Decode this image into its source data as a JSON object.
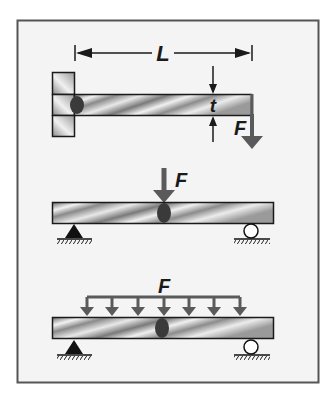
{
  "diagram": {
    "colors": {
      "frame_border": "#555555",
      "frame_fill": "#f4f4f4",
      "beam_outline": "#1a1a1a",
      "load_arrow": "#5a5a5a",
      "weld_dot": "#3a3a3a",
      "support": "#111111"
    },
    "panels": [
      {
        "name": "cantilever",
        "dimension_length_label": "L",
        "thickness_label": "t",
        "force_label": "F"
      },
      {
        "name": "simply-supported-point-load",
        "force_label": "F"
      },
      {
        "name": "simply-supported-distributed-load",
        "force_label": "F",
        "arrow_count": 7
      }
    ]
  }
}
